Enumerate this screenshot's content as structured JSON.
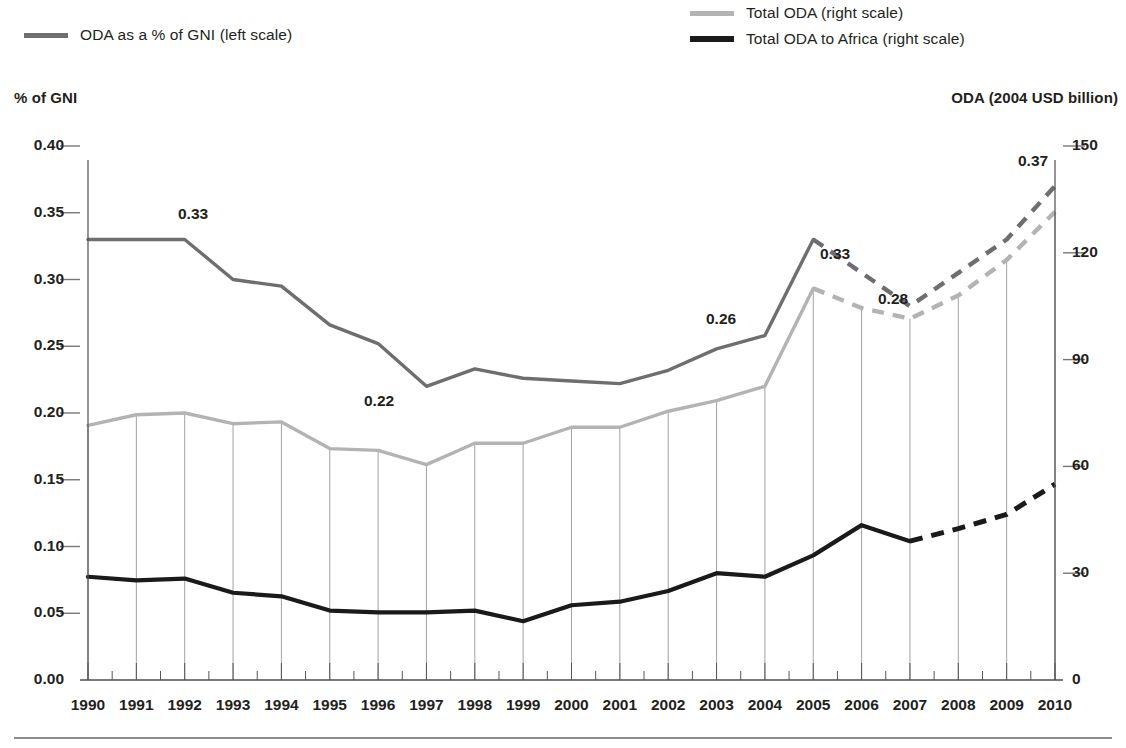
{
  "legend": {
    "items": [
      {
        "key": "gni",
        "label": "ODA as a % of GNI (left scale)",
        "color": "#6e6e6e"
      },
      {
        "key": "total",
        "label": "Total ODA (right scale)",
        "color": "#b3b3b3"
      },
      {
        "key": "africa",
        "label": "Total ODA to Africa (right scale)",
        "color": "#1a1a1a"
      }
    ]
  },
  "axes": {
    "left_title": "% of GNI",
    "right_title": "ODA (2004 USD billion)",
    "left_ticks": [
      "0.40",
      "0.35",
      "0.30",
      "0.25",
      "0.20",
      "0.15",
      "0.10",
      "0.05",
      "0.00"
    ],
    "right_ticks": [
      "150",
      "120",
      "90",
      "60",
      "30",
      "0"
    ],
    "x_ticks": [
      "1990",
      "1991",
      "1992",
      "1993",
      "1994",
      "1995",
      "1996",
      "1997",
      "1998",
      "1999",
      "2000",
      "2001",
      "2002",
      "2003",
      "2004",
      "2005",
      "2006",
      "2007",
      "2008",
      "2009",
      "2010"
    ]
  },
  "annotations": [
    {
      "text": "0.33",
      "x": 178,
      "y": 205
    },
    {
      "text": "0.22",
      "x": 364,
      "y": 392
    },
    {
      "text": "0.26",
      "x": 706,
      "y": 310
    },
    {
      "text": "0.33",
      "x": 820,
      "y": 245
    },
    {
      "text": "0.28",
      "x": 878,
      "y": 290
    },
    {
      "text": "0.37",
      "x": 1018,
      "y": 152
    }
  ],
  "chart_data": {
    "type": "line",
    "title": "",
    "xlabel": "",
    "ylabel": "% of GNI",
    "y2label": "ODA (2004 USD billion)",
    "x": [
      1990,
      1991,
      1992,
      1993,
      1994,
      1995,
      1996,
      1997,
      1998,
      1999,
      2000,
      2001,
      2002,
      2003,
      2004,
      2005,
      2006,
      2007,
      2008,
      2009,
      2010
    ],
    "ylim": [
      0.0,
      0.4
    ],
    "y2lim": [
      0,
      150
    ],
    "grid": "vertical-connectors-between-right-scale-series",
    "legend_position": "top",
    "projection_starts": 2005,
    "series": [
      {
        "name": "ODA as a % of GNI (left scale)",
        "axis": "left",
        "color": "#6e6e6e",
        "values": [
          0.33,
          0.33,
          0.33,
          0.3,
          0.295,
          0.266,
          0.252,
          0.22,
          0.233,
          0.226,
          0.224,
          0.222,
          0.232,
          0.248,
          0.258,
          0.33,
          0.305,
          0.28,
          0.305,
          0.33,
          0.37
        ],
        "solid_until": 2005,
        "dashed_from": 2005,
        "labeled_points": [
          {
            "x": 1992,
            "label": "0.33"
          },
          {
            "x": 1997,
            "label": "0.22"
          },
          {
            "x": 2004,
            "label": "0.26"
          },
          {
            "x": 2005,
            "label": "0.33"
          },
          {
            "x": 2007,
            "label": "0.28"
          },
          {
            "x": 2010,
            "label": "0.37"
          }
        ]
      },
      {
        "name": "Total ODA (right scale)",
        "axis": "right",
        "color": "#b3b3b3",
        "values": [
          71.5,
          74.5,
          75.0,
          72.0,
          72.5,
          65.0,
          64.5,
          60.5,
          66.5,
          66.5,
          71.0,
          71.0,
          75.5,
          78.5,
          82.5,
          110.0,
          104.5,
          101.5,
          108.0,
          118.0,
          131.5
        ],
        "solid_until": 2005,
        "dashed_from": 2005
      },
      {
        "name": "Total ODA to Africa (right scale)",
        "axis": "right",
        "color": "#1a1a1a",
        "values": [
          29.0,
          28.0,
          28.5,
          24.5,
          23.5,
          19.5,
          19.0,
          19.0,
          19.5,
          16.5,
          21.0,
          22.0,
          25.0,
          30.0,
          29.0,
          35.0,
          43.5,
          39.0,
          42.5,
          46.5,
          55.0
        ],
        "solid_until": 2007,
        "dashed_from": 2007
      }
    ]
  }
}
